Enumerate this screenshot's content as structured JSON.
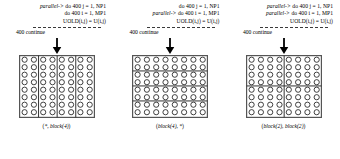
{
  "figure": {
    "grid": {
      "rows": 8,
      "cols": 8,
      "circle_color": "#2b2b2b",
      "border_color": "#555555",
      "divider_color": "#333333"
    },
    "panels": [
      {
        "id": "panel-star-block4",
        "code": {
          "line1_prefix": "parallel->",
          "line1": "do 400 j = 1, NP1",
          "line2_prefix": "",
          "line2": "do 400 i = 1, MP1",
          "line3": "UOLD(i,j) = U(i,j)"
        },
        "continue_label": "400 continue",
        "arrow": "down-arrow",
        "distribution": {
          "open": "(",
          "first": "*",
          "sep": ", ",
          "second": "block(4)",
          "close": ")"
        },
        "dividers": {
          "vertical": [
            2,
            4,
            6
          ],
          "horizontal": []
        }
      },
      {
        "id": "panel-block4-star",
        "code": {
          "line1_prefix": "",
          "line1": "do 400 j = 1, NP1",
          "line2_prefix": "parallel->",
          "line2": "do 400 i = 1, MP1",
          "line3": "UOLD(i,j) = U(i,j)"
        },
        "continue_label": "400 continue",
        "arrow": "down-arrow",
        "distribution": {
          "open": "(",
          "first": "block(4)",
          "sep": ", ",
          "second": "*",
          "close": ")"
        },
        "dividers": {
          "vertical": [],
          "horizontal": [
            2,
            4,
            6
          ]
        }
      },
      {
        "id": "panel-block2-block2",
        "code": {
          "line1_prefix": "parallel->",
          "line1": "do 400 j = 1, NP1",
          "line2_prefix": "parallel->",
          "line2": "do 400 i = 1, MP1",
          "line3": "UOLD(i,j) = U(i,j)"
        },
        "continue_label": "400 continue",
        "arrow": "down-arrow",
        "distribution": {
          "open": "(",
          "first": "block(2)",
          "sep": ", ",
          "second": "block(2)",
          "close": ")"
        },
        "dividers": {
          "vertical": [
            4
          ],
          "horizontal": [
            4
          ]
        }
      }
    ]
  }
}
